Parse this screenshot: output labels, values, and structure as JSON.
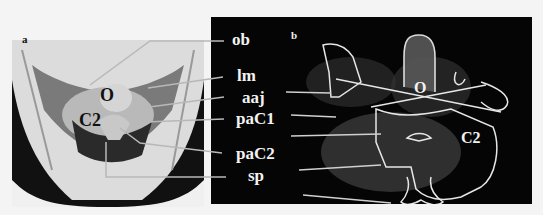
{
  "figure": {
    "panel_a": {
      "letter": "a",
      "bone_labels": {
        "occiput": "O",
        "axis": "C2"
      }
    },
    "panel_b": {
      "letter": "b",
      "bone_labels": {
        "occiput": "O",
        "axis": "C2"
      }
    },
    "labels": [
      {
        "id": "ob",
        "text": "ob"
      },
      {
        "id": "lm",
        "text": "lm"
      },
      {
        "id": "aaj",
        "text": "aaj"
      },
      {
        "id": "paC1",
        "text": "paC1"
      },
      {
        "id": "paC2",
        "text": "paC2"
      },
      {
        "id": "sp",
        "text": "sp"
      }
    ]
  }
}
